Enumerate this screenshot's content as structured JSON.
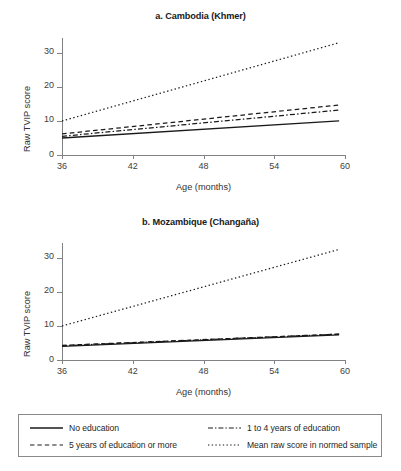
{
  "figure": {
    "panels": [
      {
        "title": "a. Cambodia (Khmer)",
        "xlabel": "Age (months)",
        "ylabel": "Raw TVIP score"
      },
      {
        "title": "b. Mozambique (Changaña)",
        "xlabel": "Age (months)",
        "ylabel": "Raw TVIP score"
      }
    ],
    "yticks": [
      "0",
      "10",
      "20",
      "30"
    ],
    "xticks": [
      "36",
      "42",
      "48",
      "54",
      "60"
    ],
    "legend": {
      "items": [
        {
          "label": "No education",
          "style": "solid",
          "icon": "solid-line-icon"
        },
        {
          "label": "1 to 4 years of education",
          "style": "dashdot",
          "icon": "dash-dot-line-icon"
        },
        {
          "label": "5 years of education or more",
          "style": "dashed",
          "icon": "dashed-line-icon"
        },
        {
          "label": "Mean raw score in normed sample",
          "style": "dotted",
          "icon": "dotted-line-icon"
        }
      ]
    },
    "colors": {
      "line": "#1a1a1a",
      "axis": "#808285",
      "text": "#333333"
    }
  },
  "chart_data": [
    {
      "type": "line",
      "title": "a. Cambodia (Khmer)",
      "xlabel": "Age (months)",
      "ylabel": "Raw TVIP score",
      "xlim": [
        36,
        60
      ],
      "ylim": [
        0,
        33.5
      ],
      "xticks": [
        36,
        42,
        48,
        54,
        60
      ],
      "yticks": [
        0,
        10,
        20,
        30
      ],
      "grid": false,
      "legend_position": "below-figure",
      "x": [
        36,
        59.5
      ],
      "series": [
        {
          "name": "No education",
          "style": "solid",
          "values": [
            5.0,
            10.0
          ]
        },
        {
          "name": "1 to 4 years of education",
          "style": "dashdot",
          "values": [
            5.5,
            13.2
          ]
        },
        {
          "name": "5 years of education or more",
          "style": "dashed",
          "values": [
            6.2,
            14.7
          ]
        },
        {
          "name": "Mean raw score in normed sample",
          "style": "dotted",
          "values": [
            10.0,
            33.0
          ]
        }
      ]
    },
    {
      "type": "line",
      "title": "b. Mozambique (Changaña)",
      "xlabel": "Age (months)",
      "ylabel": "Raw TVIP score",
      "xlim": [
        36,
        60
      ],
      "ylim": [
        0,
        33.5
      ],
      "xticks": [
        36,
        42,
        48,
        54,
        60
      ],
      "yticks": [
        0,
        10,
        20,
        30
      ],
      "grid": false,
      "legend_position": "below-figure",
      "x": [
        36,
        59.5
      ],
      "series": [
        {
          "name": "No education",
          "style": "solid",
          "values": [
            4.0,
            7.4
          ]
        },
        {
          "name": "1 to 4 years of education",
          "style": "dashdot",
          "values": [
            4.2,
            7.6
          ]
        },
        {
          "name": "5 years of education or more",
          "style": "dashed",
          "values": [
            4.3,
            7.6
          ]
        },
        {
          "name": "Mean raw score in normed sample",
          "style": "dotted",
          "values": [
            10.0,
            32.5
          ]
        }
      ]
    }
  ]
}
